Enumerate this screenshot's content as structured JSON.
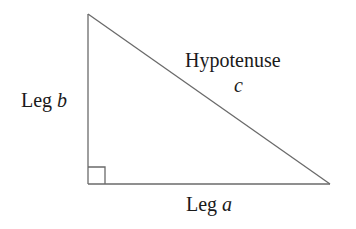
{
  "figure": {
    "background_color": "#ffffff",
    "line_color": "#6a6a6a",
    "text_color": "#1a1a1a",
    "width": 356,
    "height": 229
  },
  "geometry": {
    "apex": {
      "x": 88,
      "y": 14
    },
    "right_angle_corner": {
      "x": 88,
      "y": 184
    },
    "bottom_right": {
      "x": 330,
      "y": 184
    },
    "right_angle_marker_size": 17
  },
  "labels": {
    "leg_b_text": "Leg ",
    "leg_b_var": "b",
    "hypotenuse_text": "Hypotenuse",
    "hypotenuse_var": "c",
    "leg_a_text": "Leg ",
    "leg_a_var": "a"
  }
}
